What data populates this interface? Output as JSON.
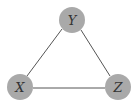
{
  "diagram": {
    "type": "undirected-graph",
    "colors": {
      "node_fill": "#a9a9a9",
      "edge": "#555555",
      "label": "#333333",
      "background": "#ffffff"
    },
    "nodes": [
      {
        "id": "Y",
        "label": "Y",
        "cx": 72,
        "cy": 20,
        "r": 13
      },
      {
        "id": "X",
        "label": "X",
        "cx": 20,
        "cy": 87,
        "r": 13
      },
      {
        "id": "Z",
        "label": "Z",
        "cx": 118,
        "cy": 87,
        "r": 13
      }
    ],
    "edges": [
      {
        "from": "Y",
        "to": "X"
      },
      {
        "from": "Y",
        "to": "Z"
      },
      {
        "from": "X",
        "to": "Z"
      }
    ]
  }
}
